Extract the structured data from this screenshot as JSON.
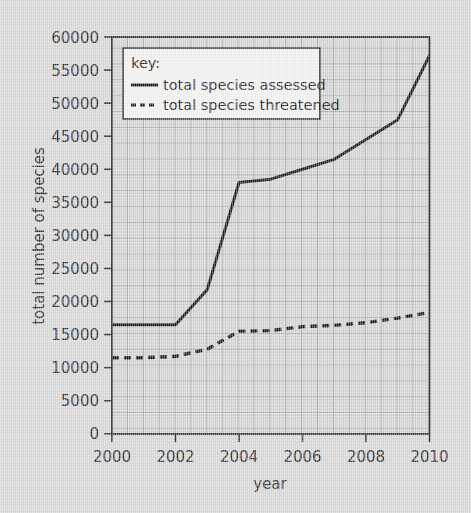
{
  "chart_data": {
    "type": "line",
    "title": "",
    "xlabel": "year",
    "ylabel": "total number of species",
    "xlim": [
      2000,
      2010
    ],
    "ylim": [
      0,
      60000
    ],
    "grid": true,
    "grid_minor": true,
    "legend_position": "top-left",
    "legend_title": "key:",
    "x": [
      2000,
      2001,
      2002,
      2003,
      2004,
      2005,
      2006,
      2007,
      2008,
      2009,
      2010
    ],
    "xticks": [
      2000,
      2002,
      2004,
      2006,
      2008,
      2010
    ],
    "xticklabels": [
      "2000",
      "2002",
      "2004",
      "2006",
      "2008",
      "2010"
    ],
    "yticks": [
      0,
      5000,
      10000,
      15000,
      20000,
      25000,
      30000,
      35000,
      40000,
      45000,
      50000,
      55000,
      60000
    ],
    "yticklabels": [
      "0",
      "5000",
      "10000",
      "15000",
      "20000",
      "25000",
      "30000",
      "35000",
      "40000",
      "45000",
      "50000",
      "55000",
      "60000"
    ],
    "series": [
      {
        "name": "total species assessed",
        "style": "solid",
        "color": "#1a1a1a",
        "values": [
          16500,
          16500,
          16500,
          21800,
          38000,
          38500,
          40000,
          41500,
          44500,
          47500,
          57200
        ]
      },
      {
        "name": "total species threatened",
        "style": "dashed",
        "color": "#1a1a1a",
        "values": [
          11500,
          11500,
          11700,
          12800,
          15500,
          15600,
          16200,
          16400,
          16800,
          17500,
          18350
        ]
      }
    ]
  },
  "axes": {
    "x_title": "year",
    "y_title": "total number of species"
  },
  "legend": {
    "title": "key:",
    "entries": [
      {
        "label": "total species assessed",
        "style": "solid"
      },
      {
        "label": "total species threatened",
        "style": "dashed"
      }
    ]
  }
}
